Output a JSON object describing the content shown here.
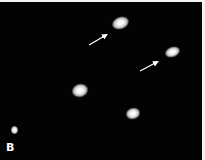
{
  "figure": {
    "panel_label": "B",
    "background_color": "#030303",
    "border_color": "#f2f2f2",
    "spots": [
      {
        "id": "spot-1",
        "cx": 120,
        "cy": 21,
        "w": 17,
        "h": 12,
        "rotate": -20,
        "arrowed": true
      },
      {
        "id": "spot-2",
        "cx": 172,
        "cy": 50,
        "w": 15,
        "h": 10,
        "rotate": -20,
        "arrowed": true
      },
      {
        "id": "spot-3",
        "cx": 80,
        "cy": 88,
        "w": 16,
        "h": 13,
        "rotate": -15,
        "arrowed": false
      },
      {
        "id": "spot-4",
        "cx": 133,
        "cy": 111,
        "w": 14,
        "h": 11,
        "rotate": -15,
        "arrowed": false
      },
      {
        "id": "spot-5",
        "cx": 14,
        "cy": 128,
        "w": 7,
        "h": 8,
        "rotate": 0,
        "arrowed": false
      }
    ],
    "arrows": [
      {
        "id": "arrow-1",
        "x1": 89,
        "y1": 43,
        "x2": 108,
        "y2": 32,
        "color": "#ffffff"
      },
      {
        "id": "arrow-2",
        "x1": 140,
        "y1": 69,
        "x2": 159,
        "y2": 59,
        "color": "#ffffff"
      }
    ]
  }
}
